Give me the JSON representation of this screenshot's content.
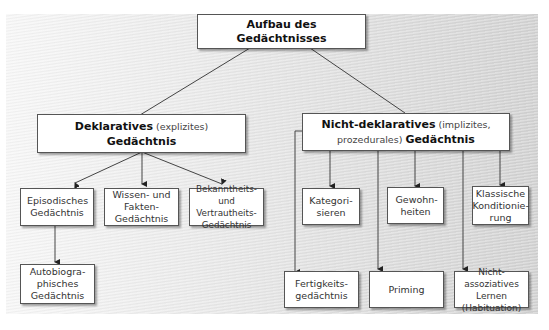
{
  "diagram": {
    "root": {
      "line1": "Aufbau des",
      "line2": "Gedächtnisses"
    },
    "declarative": {
      "bold1": "Deklaratives",
      "normal1": " (explizites)",
      "bold2": "Gedächtnis"
    },
    "nondeclarative": {
      "bold1": "Nicht-deklaratives",
      "normal1": " (implizites,",
      "normal2": "prozedurales) ",
      "bold2": "Gedächtnis"
    },
    "declarative_children": [
      {
        "text": "Episodisches Gedächtnis"
      },
      {
        "text": "Wissen- und Fakten-Gedächtnis"
      },
      {
        "text": "Bekanntheits- und Vertrautheits-Gedächtnis"
      }
    ],
    "episodic_child": {
      "text": "Autobiogra-phisches Gedächtnis"
    },
    "nondeclarative_children_top": [
      {
        "text": "Kategori-sieren"
      },
      {
        "text": "Gewohn-heiten"
      },
      {
        "text": "Klassische Konditionie-rung"
      }
    ],
    "nondeclarative_children_bottom": [
      {
        "text": "Fertigkeits-gedächtnis"
      },
      {
        "text": "Priming"
      },
      {
        "text": "Nicht-assoziatives Lernen (Habituation)"
      }
    ]
  }
}
